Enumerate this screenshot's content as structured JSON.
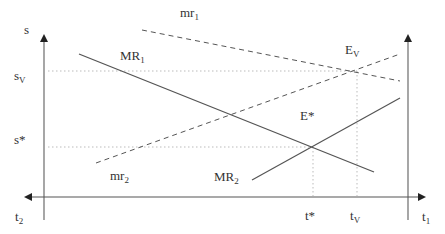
{
  "diagram": {
    "axes": {
      "left_vertical_label": "s",
      "horizontal_left_label": "t",
      "horizontal_left_sub": "2",
      "horizontal_right_label": "t",
      "horizontal_right_sub": "1"
    },
    "y_ticks": {
      "sv_main": "s",
      "sv_sub": "V",
      "sstar": "s*"
    },
    "x_ticks": {
      "tstar": "t*",
      "tv_main": "t",
      "tv_sub": "V"
    },
    "curves": {
      "MR1_main": "MR",
      "MR1_sub": "1",
      "MR2_main": "MR",
      "MR2_sub": "2",
      "mr1_main": "mr",
      "mr1_sub": "1",
      "mr2_main": "mr",
      "mr2_sub": "2"
    },
    "points": {
      "Ev_main": "E",
      "Ev_sub": "V",
      "Estar": "E*"
    },
    "colors": {
      "line": "#555555",
      "axis": "#666666",
      "guide": "#bbbbbb",
      "text": "#333333"
    }
  }
}
